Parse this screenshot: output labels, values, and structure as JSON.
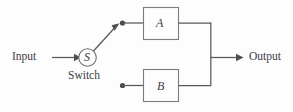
{
  "diagram": {
    "colors": {
      "background": "#fdfdfd",
      "wire": "#59595c",
      "box_stroke": "#7b7b80",
      "text": "#3b3b3f",
      "node": "#4a4a4e"
    },
    "labels": {
      "input": "Input",
      "switch": "Switch",
      "output": "Output",
      "switch_symbol": "S",
      "block_a": "A",
      "block_b": "B"
    },
    "nodes": [
      {
        "id": "input-terminal",
        "label": "Input",
        "type": "terminal"
      },
      {
        "id": "switch",
        "label": "S",
        "caption": "Switch",
        "type": "circle"
      },
      {
        "id": "junction-top",
        "label": "",
        "type": "dot"
      },
      {
        "id": "junction-bottom",
        "label": "",
        "type": "dot"
      },
      {
        "id": "block-a",
        "label": "A",
        "type": "box"
      },
      {
        "id": "block-b",
        "label": "B",
        "type": "box"
      },
      {
        "id": "output-terminal",
        "label": "Output",
        "type": "terminal"
      }
    ],
    "edges": [
      {
        "from": "input-terminal",
        "to": "switch",
        "arrow": true
      },
      {
        "from": "switch",
        "to": "junction-top",
        "arrow": true
      },
      {
        "from": "junction-top",
        "to": "block-a",
        "arrow": false
      },
      {
        "from": "junction-bottom",
        "to": "block-b",
        "arrow": false
      },
      {
        "from": "block-a",
        "to": "output-terminal",
        "arrow": true
      },
      {
        "from": "block-b",
        "to": "output-terminal",
        "arrow": true
      }
    ]
  }
}
